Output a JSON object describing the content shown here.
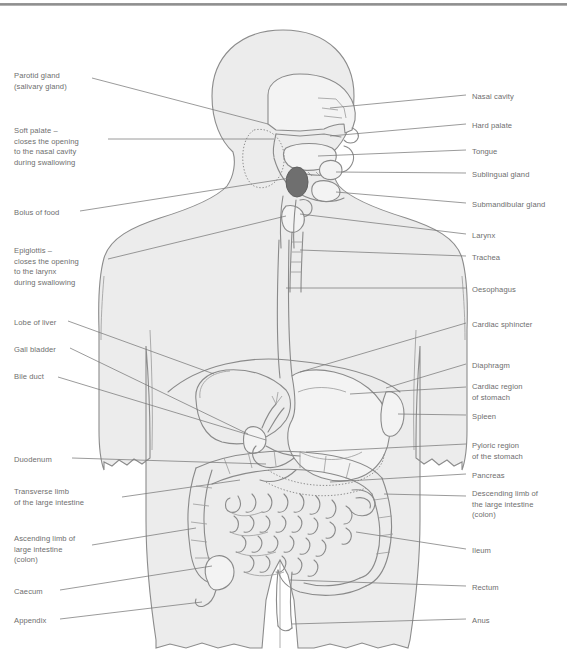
{
  "page": {
    "type": "anatomical-diagram",
    "width": 567,
    "height": 662,
    "background": "#ffffff",
    "rule_color": "#8e8e8e"
  },
  "style": {
    "label_color": "#6e6e6e",
    "leader_color": "#7a7a7a",
    "body_fill": "#ececec",
    "body_stroke": "#8c8c8c",
    "organ_stroke": "#8a8a8a",
    "organ_fill": "#f2f2f2",
    "bolus_fill": "#6f6f6f"
  },
  "labels_left": [
    {
      "id": "parotid-gland",
      "text": "Parotid gland\n(salivary gland)",
      "x": 14,
      "y": 71
    },
    {
      "id": "soft-palate",
      "text": "Soft palate –\ncloses the opening\nto the nasal cavity\nduring swallowing",
      "x": 14,
      "y": 126
    },
    {
      "id": "bolus-of-food",
      "text": "Bolus of food",
      "x": 14,
      "y": 208
    },
    {
      "id": "epiglottis",
      "text": "Epiglottis –\ncloses the opening\nto the larynx\nduring swallowing",
      "x": 14,
      "y": 246
    },
    {
      "id": "lobe-of-liver",
      "text": "Lobe of liver",
      "x": 14,
      "y": 318
    },
    {
      "id": "gall-bladder",
      "text": "Gall bladder",
      "x": 14,
      "y": 345
    },
    {
      "id": "bile-duct",
      "text": "Bile duct",
      "x": 14,
      "y": 372
    },
    {
      "id": "duodenum",
      "text": "Duodenum",
      "x": 14,
      "y": 455
    },
    {
      "id": "transverse-limb",
      "text": "Transverse limb\nof the large intestine",
      "x": 14,
      "y": 487
    },
    {
      "id": "ascending-limb",
      "text": "Ascending limb of\nlarge intestine\n(colon)",
      "x": 14,
      "y": 534
    },
    {
      "id": "caecum",
      "text": "Caecum",
      "x": 14,
      "y": 587
    },
    {
      "id": "appendix",
      "text": "Appendix",
      "x": 14,
      "y": 616
    }
  ],
  "labels_right": [
    {
      "id": "nasal-cavity",
      "text": "Nasal cavity",
      "x": 472,
      "y": 92
    },
    {
      "id": "hard-palate",
      "text": "Hard palate",
      "x": 472,
      "y": 121
    },
    {
      "id": "tongue",
      "text": "Tongue",
      "x": 472,
      "y": 147
    },
    {
      "id": "sublingual-gland",
      "text": "Sublingual gland",
      "x": 472,
      "y": 170
    },
    {
      "id": "submandibular-gland",
      "text": "Submandibular gland",
      "x": 472,
      "y": 200
    },
    {
      "id": "larynx",
      "text": "Larynx",
      "x": 472,
      "y": 231
    },
    {
      "id": "trachea",
      "text": "Trachea",
      "x": 472,
      "y": 253
    },
    {
      "id": "oesophagus",
      "text": "Oesophagus",
      "x": 472,
      "y": 285
    },
    {
      "id": "cardiac-sphincter",
      "text": "Cardiac sphincter",
      "x": 472,
      "y": 320
    },
    {
      "id": "diaphragm",
      "text": "Diaphragm",
      "x": 472,
      "y": 361
    },
    {
      "id": "cardiac-region",
      "text": "Cardiac region\nof stomach",
      "x": 472,
      "y": 382
    },
    {
      "id": "spleen",
      "text": "Spleen",
      "x": 472,
      "y": 412
    },
    {
      "id": "pyloric-region",
      "text": "Pyloric region\nof the stomach",
      "x": 472,
      "y": 441
    },
    {
      "id": "pancreas",
      "text": "Pancreas",
      "x": 472,
      "y": 471
    },
    {
      "id": "descending-limb",
      "text": "Descending limb of\nthe large intestine\n(colon)",
      "x": 472,
      "y": 489
    },
    {
      "id": "ileum",
      "text": "Ileum",
      "x": 472,
      "y": 546
    },
    {
      "id": "rectum",
      "text": "Rectum",
      "x": 472,
      "y": 583
    },
    {
      "id": "anus",
      "text": "Anus",
      "x": 472,
      "y": 616
    }
  ],
  "organs": [
    "nasal-cavity",
    "hard-palate",
    "soft-palate",
    "tongue",
    "sublingual-gland",
    "submandibular-gland",
    "parotid-gland",
    "epiglottis",
    "larynx",
    "trachea",
    "oesophagus",
    "bolus-of-food",
    "cardiac-sphincter",
    "diaphragm",
    "stomach",
    "spleen",
    "liver",
    "gall-bladder",
    "bile-duct",
    "duodenum",
    "pancreas",
    "small-intestine",
    "ileum",
    "caecum",
    "appendix",
    "ascending-colon",
    "transverse-colon",
    "descending-colon",
    "rectum",
    "anus"
  ]
}
